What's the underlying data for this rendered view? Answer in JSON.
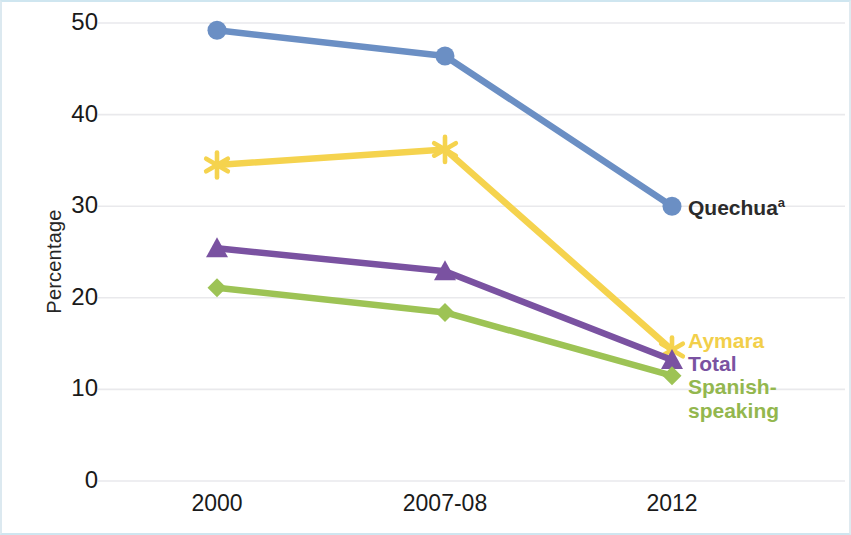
{
  "chart_data": {
    "type": "line",
    "title": "",
    "subtitle": "",
    "xlabel": "",
    "ylabel": "Percentage",
    "categories": [
      "2000",
      "2007-08",
      "2012"
    ],
    "ylim": [
      0,
      50
    ],
    "yticks": [
      0,
      10,
      20,
      30,
      40,
      50
    ],
    "grid": true,
    "legend_position": "right-of-line-ends",
    "series": [
      {
        "name": "Quechua",
        "name_superscript": "a",
        "color": "#6b8fc4",
        "marker": "circle",
        "values": [
          49.2,
          46.4,
          30.0
        ]
      },
      {
        "name": "Aymara",
        "name_superscript": "",
        "color": "#f5d34e",
        "marker": "asterisk",
        "values": [
          34.5,
          36.2,
          14.3
        ]
      },
      {
        "name": "Total",
        "name_superscript": "",
        "color": "#7a52a1",
        "marker": "triangle",
        "values": [
          25.4,
          22.9,
          13.2
        ]
      },
      {
        "name": "Spanish-speaking",
        "name_superscript": "",
        "color": "#9dc355",
        "marker": "diamond",
        "values": [
          21.1,
          18.4,
          11.5
        ]
      }
    ]
  },
  "labels": {
    "y_axis_title": "Percentage",
    "quechua": "Quechua",
    "quechua_sup": "a",
    "aymara": "Aymara",
    "total": "Total",
    "spanish_line1": "Spanish-",
    "spanish_line2": "speaking"
  },
  "colors": {
    "frame": "#cfe6f0",
    "gridline": "#e9e9ec",
    "tick_text": "#1a1a1a",
    "quechua": "#6b8fc4",
    "aymara": "#f5d34e",
    "total": "#7a52a1",
    "spanish": "#9dc355"
  }
}
